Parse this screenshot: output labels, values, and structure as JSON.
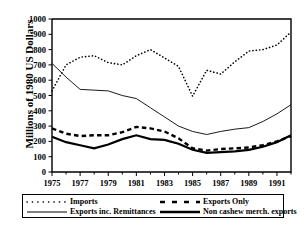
{
  "chart_data": {
    "type": "line",
    "title": "",
    "xlabel": "",
    "ylabel": "Millions of 1980 US Dollars",
    "xlim": [
      1975,
      1992
    ],
    "ylim": [
      0,
      1000
    ],
    "grid": false,
    "legend_position": "below-axes",
    "ytick_labels": [
      "0",
      "100",
      "200",
      "300",
      "400",
      "500",
      "600",
      "700",
      "800",
      "900",
      "1000"
    ],
    "ytick_values": [
      0,
      100,
      200,
      300,
      400,
      500,
      600,
      700,
      800,
      900,
      1000
    ],
    "xtick_labels": [
      "1975",
      "1977",
      "1979",
      "1981",
      "1983",
      "1985",
      "1987",
      "1989",
      "1991"
    ],
    "xtick_values": [
      1975,
      1977,
      1979,
      1981,
      1983,
      1985,
      1987,
      1989,
      1991
    ],
    "x": [
      1975,
      1976,
      1977,
      1978,
      1979,
      1980,
      1981,
      1982,
      1983,
      1984,
      1985,
      1986,
      1987,
      1988,
      1989,
      1990,
      1991,
      1992
    ],
    "series": [
      {
        "name": "Imports",
        "style": "dotted",
        "values": [
          530,
          700,
          750,
          760,
          715,
          700,
          760,
          800,
          745,
          690,
          495,
          665,
          640,
          720,
          790,
          800,
          830,
          915
        ]
      },
      {
        "name": "Exports inc. Remittances",
        "style": "thin-solid",
        "values": [
          710,
          620,
          540,
          535,
          530,
          500,
          480,
          420,
          360,
          300,
          265,
          245,
          265,
          280,
          290,
          330,
          380,
          440
        ]
      },
      {
        "name": "Exports Only",
        "style": "bold-dashed",
        "values": [
          285,
          250,
          235,
          240,
          240,
          260,
          295,
          285,
          265,
          220,
          155,
          140,
          150,
          155,
          160,
          175,
          200,
          235
        ]
      },
      {
        "name": "Non cashew merch. exports",
        "style": "bold-solid",
        "values": [
          230,
          195,
          175,
          155,
          180,
          215,
          240,
          215,
          210,
          185,
          145,
          125,
          130,
          135,
          145,
          165,
          195,
          240
        ]
      }
    ]
  },
  "legend": {
    "entries": [
      {
        "label": "Imports",
        "marker": "dotted-line-swatch"
      },
      {
        "label": "Exports inc. Remittances",
        "marker": "thin-solid-line-swatch"
      },
      {
        "label": "Exports Only",
        "marker": "bold-dashed-line-swatch"
      },
      {
        "label": "Non cashew merch. exports",
        "marker": "bold-solid-line-swatch"
      }
    ]
  },
  "colors": {
    "foreground": "#000000",
    "background": "#ffffff"
  }
}
